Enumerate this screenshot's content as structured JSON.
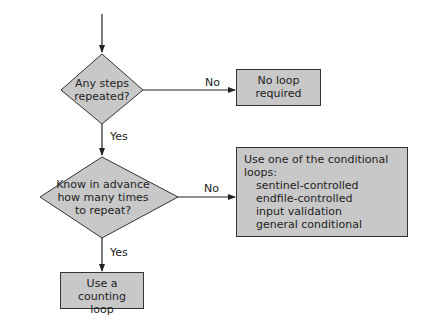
{
  "flowchart": {
    "decision1": {
      "text_line1": "Any steps",
      "text_line2": "repeated?"
    },
    "decision1_no": "No",
    "decision1_yes": "Yes",
    "no_loop_box": {
      "line1": "No loop",
      "line2": "required"
    },
    "decision2": {
      "line1": "Know in advance",
      "line2": "how many times",
      "line3": "to repeat?"
    },
    "decision2_no": "No",
    "decision2_yes": "Yes",
    "conditional_box": {
      "heading": "Use one of the conditional loops:",
      "items": [
        "sentinel-controlled",
        "endfile-controlled",
        "input validation",
        "general conditional"
      ]
    },
    "counting_box": {
      "line1": "Use a counting",
      "line2": "loop"
    }
  },
  "colors": {
    "fill": "#c8c8c8",
    "stroke": "#222222"
  }
}
